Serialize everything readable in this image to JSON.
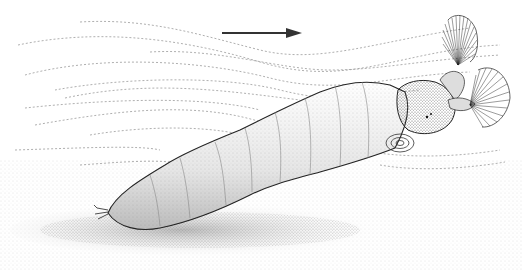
{
  "illustration": {
    "subject": "larva-in-current",
    "current_arrow": {
      "direction": "right",
      "color": "#333333"
    },
    "colors": {
      "background": "#ffffff",
      "ink": "#222222",
      "stipple": "#888888",
      "flow_lines": "#9a9a9a"
    }
  }
}
